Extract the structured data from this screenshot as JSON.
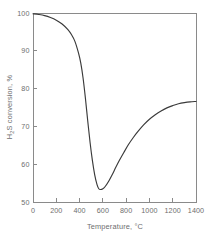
{
  "chart_data": {
    "type": "line",
    "title": "",
    "xlabel": "Temperature, °C",
    "ylabel": "H₂S conversion, %",
    "ylabel_main": "S conversion, %",
    "ylabel_prefix": "H",
    "ylabel_sub": "2",
    "xlim": [
      0,
      1400
    ],
    "ylim": [
      50,
      100
    ],
    "xticks": [
      0,
      200,
      400,
      600,
      800,
      1000,
      1200,
      1400
    ],
    "xtick_labels": [
      "0",
      "200",
      "400",
      "600",
      "800",
      "1000",
      "1200",
      "1400"
    ],
    "yticks": [
      50,
      60,
      70,
      80,
      90,
      100
    ],
    "ytick_labels": [
      "50",
      "60",
      "70",
      "80",
      "90",
      "100"
    ],
    "grid": false,
    "legend": null,
    "series": [
      {
        "name": "H2S conversion",
        "color": "#3a3a3a",
        "x": [
          0,
          50,
          100,
          150,
          200,
          250,
          300,
          330,
          360,
          390,
          410,
          430,
          450,
          470,
          490,
          510,
          530,
          550,
          565,
          580,
          600,
          620,
          650,
          680,
          710,
          740,
          780,
          820,
          860,
          900,
          950,
          1000,
          1050,
          1100,
          1150,
          1200,
          1250,
          1300,
          1350,
          1400
        ],
        "y": [
          99.8,
          99.6,
          99.3,
          98.8,
          98.1,
          97.1,
          95.6,
          94.3,
          92.5,
          89.5,
          86.8,
          82.8,
          77.5,
          71.5,
          65.8,
          61.0,
          57.2,
          54.6,
          53.5,
          53.3,
          53.5,
          54.1,
          55.5,
          57.2,
          59.1,
          60.9,
          63.1,
          65.2,
          67.0,
          68.6,
          70.4,
          71.9,
          73.1,
          74.1,
          74.9,
          75.5,
          76.0,
          76.3,
          76.5,
          76.6
        ]
      }
    ],
    "annotations": {
      "minimum_value": 53.3,
      "minimum_temperature": 575,
      "start_value": 99.8,
      "end_value": 76.6
    },
    "colors": {
      "curve": "#3a3a3a",
      "axis": "#8a8a8a",
      "text": "#6e6e6e",
      "background": "#ffffff"
    },
    "geometry": {
      "plot_left": 33,
      "plot_right": 196,
      "plot_top": 13,
      "plot_bottom": 202
    }
  }
}
